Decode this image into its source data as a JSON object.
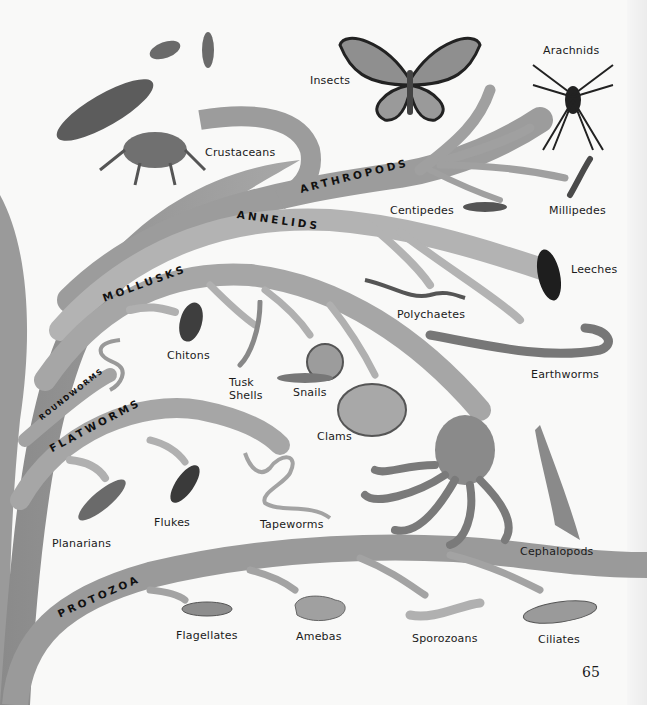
{
  "colors": {
    "page": "#f9f9f8",
    "branch": "#9c9c9c",
    "branch_light": "#b8b8b8",
    "trunk": "#8e8e8e",
    "text": "#1b1b1b"
  },
  "page_number": "65",
  "phyla": [
    {
      "id": "arthropods",
      "label": "ARTHROPODS"
    },
    {
      "id": "annelids",
      "label": "ANNELIDS"
    },
    {
      "id": "mollusks",
      "label": "MOLLUSKS"
    },
    {
      "id": "roundworms",
      "label": "ROUNDWORMS"
    },
    {
      "id": "flatworms",
      "label": "FLATWORMS"
    },
    {
      "id": "protozoa",
      "label": "PROTOZOA"
    }
  ],
  "groups": {
    "arthropods": [
      "Crustaceans",
      "Insects",
      "Arachnids",
      "Centipedes",
      "Millipedes"
    ],
    "annelids": [
      "Leeches",
      "Polychaetes",
      "Earthworms"
    ],
    "mollusks": [
      "Chitons",
      "Tusk Shells",
      "Snails",
      "Clams",
      "Cephalopods"
    ],
    "roundworms": [],
    "flatworms": [
      "Planarians",
      "Flukes",
      "Tapeworms"
    ],
    "protozoa": [
      "Flagellates",
      "Amebas",
      "Sporozoans",
      "Ciliates"
    ]
  },
  "labels": {
    "crustaceans": "Crustaceans",
    "insects": "Insects",
    "arachnids": "Arachnids",
    "centipedes": "Centipedes",
    "millipedes": "Millipedes",
    "leeches": "Leeches",
    "polychaetes": "Polychaetes",
    "earthworms": "Earthworms",
    "chitons": "Chitons",
    "tusk_shells_1": "Tusk",
    "tusk_shells_2": "Shells",
    "snails": "Snails",
    "clams": "Clams",
    "cephalopods": "Cephalopods",
    "planarians": "Planarians",
    "flukes": "Flukes",
    "tapeworms": "Tapeworms",
    "flagellates": "Flagellates",
    "amebas": "Amebas",
    "sporozoans": "Sporozoans",
    "ciliates": "Ciliates"
  }
}
